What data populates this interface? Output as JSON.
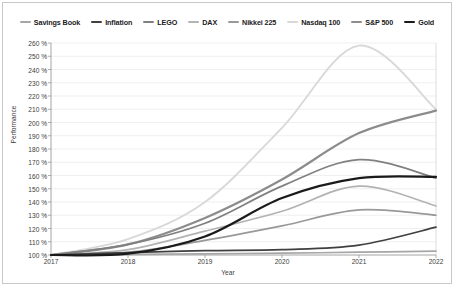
{
  "chart_data": {
    "type": "line",
    "title": "",
    "xlabel": "Year",
    "ylabel": "Performance",
    "x": [
      2017,
      2018,
      2019,
      2020,
      2021,
      2022
    ],
    "xlim": [
      2017,
      2022
    ],
    "ylim": [
      100,
      260
    ],
    "ytick_step": 10,
    "ytick_suffix": " %",
    "grid": "horizontal",
    "legend_position": "top",
    "xticks": [
      "2017",
      "2018",
      "2019",
      "2020",
      "2021",
      "2022"
    ],
    "yticks": [
      "100 %",
      "110 %",
      "120 %",
      "130 %",
      "140 %",
      "150 %",
      "160 %",
      "170 %",
      "180 %",
      "190 %",
      "200 %",
      "210 %",
      "220 %",
      "230 %",
      "240 %",
      "250 %",
      "260 %"
    ],
    "series": [
      {
        "name": "Savings Book",
        "color": "#a6a6a6",
        "width": 1.7,
        "values": [
          100,
          100.4,
          100.9,
          101.4,
          102.1,
          103.0
        ]
      },
      {
        "name": "Inflation",
        "color": "#404040",
        "width": 1.7,
        "values": [
          100,
          101.8,
          103.3,
          104.1,
          107.5,
          121.0
        ]
      },
      {
        "name": "LEGO",
        "color": "#808080",
        "width": 1.7,
        "values": [
          100,
          108,
          124,
          152,
          172,
          158
        ]
      },
      {
        "name": "DAX",
        "color": "#b3b3b3",
        "width": 1.7,
        "values": [
          100,
          104,
          118,
          133,
          152,
          137
        ]
      },
      {
        "name": "Nikkei 225",
        "color": "#999999",
        "width": 1.7,
        "values": [
          100,
          102,
          111,
          122,
          134,
          130
        ]
      },
      {
        "name": "Nasdaq 100",
        "color": "#d9d9d9",
        "width": 1.9,
        "values": [
          100,
          112,
          140,
          196,
          258,
          210
        ]
      },
      {
        "name": "S&P 500",
        "color": "#8c8c8c",
        "width": 2.2,
        "values": [
          100,
          108,
          128,
          157,
          192,
          209
        ]
      },
      {
        "name": "Gold",
        "color": "#1a1a1a",
        "width": 2.2,
        "values": [
          100,
          101,
          114,
          143,
          158,
          159
        ]
      }
    ]
  }
}
